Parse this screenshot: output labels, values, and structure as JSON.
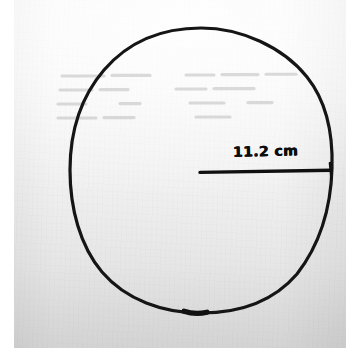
{
  "document": {
    "kind": "scanned-handwritten-worksheet",
    "medium": "black ink pen on white paper",
    "background_color": "#ffffff",
    "paper_color": "#f6f6f6",
    "ink_color": "#111111"
  },
  "figure": {
    "name": "circle-with-radius",
    "shape": "circle",
    "drawn_by_hand": true,
    "center": {
      "x": 201,
      "y": 171
    },
    "radius_px_horizontal": 131,
    "radius_px_vertical": 143,
    "segment": {
      "name": "radius-line",
      "type": "radius",
      "from": {
        "x": 200,
        "y": 172
      },
      "to": {
        "x": 331,
        "y": 170
      },
      "has_end_tick": true
    }
  },
  "annotations": {
    "measurement_label": {
      "text": "11.2 cm",
      "value": 11.2,
      "unit": "cm",
      "quantity": "radius",
      "style": "handwritten"
    }
  },
  "artifacts": {
    "show_through_text": {
      "description": "faint reverse-side writing visible through the paper",
      "legible": false,
      "rows": 4
    }
  }
}
